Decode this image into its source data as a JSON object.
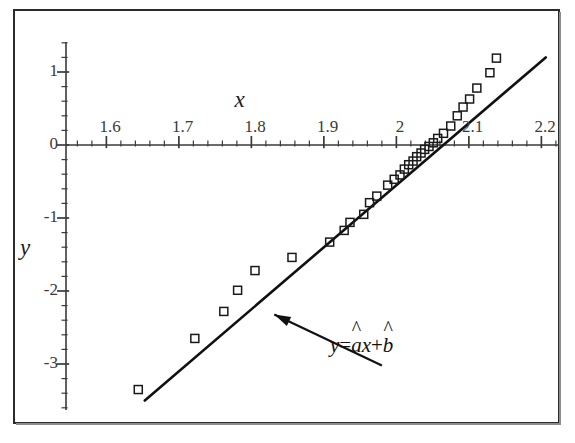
{
  "figure": {
    "width": 575,
    "height": 443,
    "background": "#ffffff",
    "frame_color": "#2b2b2b"
  },
  "annotation": {
    "equation_label": "y=âx+b̂",
    "equation_parts": {
      "y": "y",
      "equals": "=",
      "a_hat_base": "a",
      "a_hat_accent": "^",
      "x": "x",
      "plus": "+",
      "b_hat_base": "b",
      "b_hat_accent": "^"
    },
    "arrow_name": "regression-line-pointer"
  },
  "chart_data": {
    "type": "scatter",
    "title": "",
    "subtitle": "",
    "xlabel": "x",
    "ylabel": "y",
    "xlim": [
      1.555,
      2.225
    ],
    "ylim": [
      -3.85,
      1.45
    ],
    "grid": false,
    "legend": null,
    "legend_position": "none",
    "x_ticks_major": [
      1.6,
      1.7,
      1.8,
      1.9,
      2.0,
      2.1,
      2.2
    ],
    "x_tick_labels": [
      "1.6",
      "1.7",
      "1.8",
      "1.9",
      "2",
      "2.1",
      "2.2"
    ],
    "x_minor_tick_step": 0.02,
    "y_ticks_major": [
      1,
      0,
      -1,
      -2,
      -3
    ],
    "y_tick_labels": [
      "1",
      "0",
      "-1",
      "-2",
      "-3"
    ],
    "y_minor_tick_step": 0.2,
    "axes_style": "crossing-at-origin",
    "marker": "open-square",
    "marker_size": 8,
    "marker_color": "#1a1a1a",
    "series": [
      {
        "name": "observations",
        "marker": "open-square",
        "points": [
          [
            1.639,
            -3.35
          ],
          [
            1.717,
            -2.65
          ],
          [
            1.757,
            -2.28
          ],
          [
            1.776,
            -1.99
          ],
          [
            1.8,
            -1.72
          ],
          [
            1.851,
            -1.54
          ],
          [
            1.903,
            -1.33
          ],
          [
            1.923,
            -1.17
          ],
          [
            1.931,
            -1.06
          ],
          [
            1.95,
            -0.95
          ],
          [
            1.958,
            -0.79
          ],
          [
            1.968,
            -0.7
          ],
          [
            1.983,
            -0.55
          ],
          [
            1.992,
            -0.47
          ],
          [
            2.0,
            -0.41
          ],
          [
            2.006,
            -0.33
          ],
          [
            2.012,
            -0.27
          ],
          [
            2.018,
            -0.22
          ],
          [
            2.023,
            -0.16
          ],
          [
            2.029,
            -0.11
          ],
          [
            2.034,
            -0.06
          ],
          [
            2.04,
            -0.02
          ],
          [
            2.046,
            0.03
          ],
          [
            2.052,
            0.09
          ],
          [
            2.06,
            0.16
          ],
          [
            2.07,
            0.26
          ],
          [
            2.079,
            0.4
          ],
          [
            2.087,
            0.52
          ],
          [
            2.096,
            0.63
          ],
          [
            2.106,
            0.78
          ],
          [
            2.124,
            0.99
          ],
          [
            2.133,
            1.19
          ]
        ]
      }
    ],
    "fit_line": {
      "name": "least-squares-fit",
      "label": "y=âx+b̂",
      "x_start": 1.648,
      "y_start": -3.5,
      "x_end": 2.201,
      "y_end": 1.2,
      "slope": 8.5,
      "intercept": -17.51,
      "color": "#111111",
      "width": 2.6
    },
    "annotations": [
      {
        "text": "y=âx+b̂",
        "target_x": 1.817,
        "target_y": -2.24,
        "text_x": 1.975,
        "text_y": -3.02,
        "arrow": true
      }
    ]
  }
}
